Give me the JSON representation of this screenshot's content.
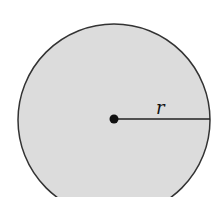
{
  "diagram": {
    "type": "circle-radius",
    "radius_label": "r",
    "colors": {
      "fill": "#dcdcdc",
      "stroke": "#333333",
      "dot": "#111111",
      "background": "#ffffff"
    }
  }
}
